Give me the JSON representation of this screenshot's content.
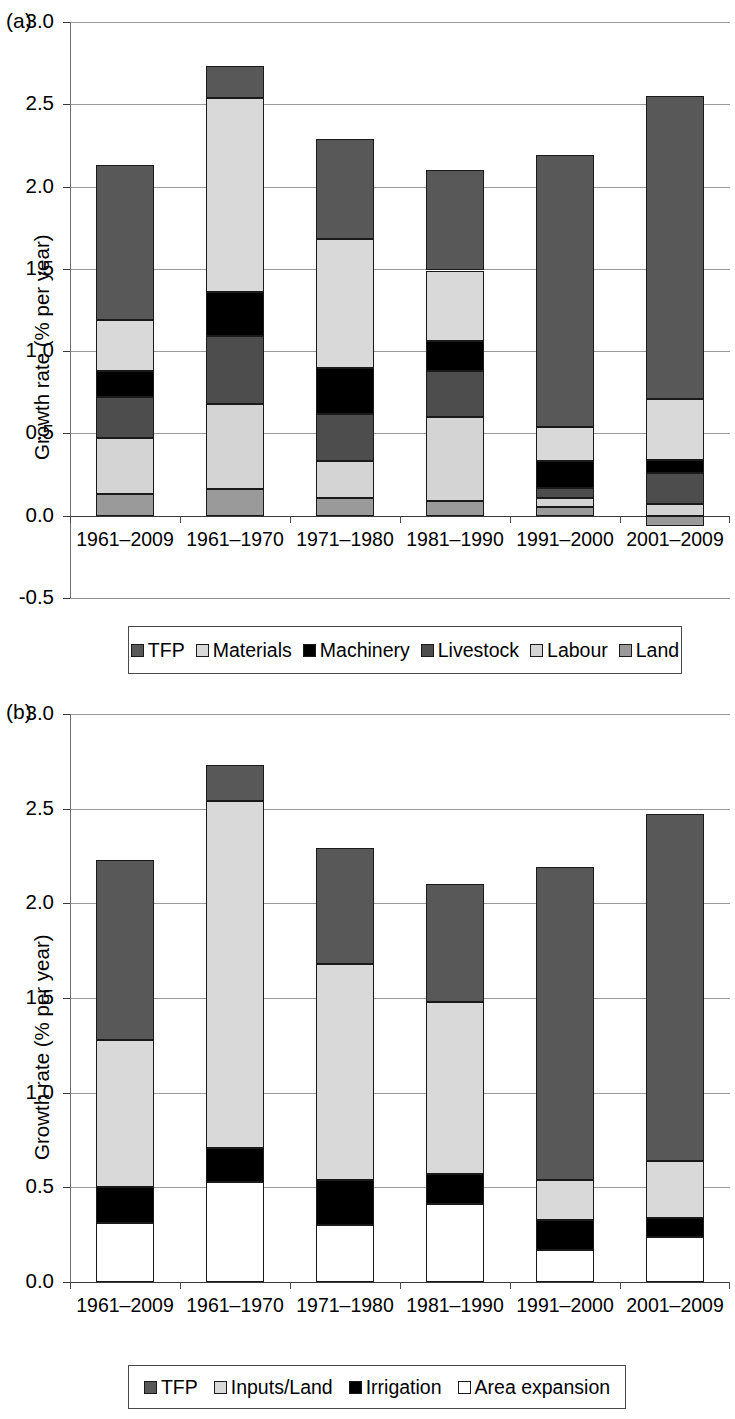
{
  "panels": [
    {
      "tag": "(a)",
      "ylabel": "Growth rate (% per year)",
      "xlabel": "",
      "legend": [
        {
          "label": "TFP",
          "color": "#585858"
        },
        {
          "label": "Materials",
          "color": "#d9d9d9"
        },
        {
          "label": "Machinery",
          "color": "#000000"
        },
        {
          "label": "Livestock",
          "color": "#4d4d4d"
        },
        {
          "label": "Labour",
          "color": "#d4d4d4"
        },
        {
          "label": "Land",
          "color": "#9a9a9a"
        }
      ]
    },
    {
      "tag": "(b)",
      "ylabel": "Growth rate (% per year)",
      "xlabel": "Year",
      "legend": [
        {
          "label": "TFP",
          "color": "#585858"
        },
        {
          "label": "Inputs/Land",
          "color": "#d9d9d9"
        },
        {
          "label": "Irrigation",
          "color": "#000000"
        },
        {
          "label": "Area expansion",
          "color": "#ffffff"
        }
      ]
    }
  ],
  "chart_data": [
    {
      "type": "bar",
      "stacked": true,
      "panel": "(a)",
      "title": "",
      "xlabel": "",
      "ylabel": "Growth rate (% per year)",
      "ylim": [
        -0.5,
        3.0
      ],
      "yticks": [
        "-0.5",
        "0.0",
        "0.5",
        "1.0",
        "1.5",
        "2.0",
        "2.5",
        "3.0"
      ],
      "ytick_values": [
        -0.5,
        0.0,
        0.5,
        1.0,
        1.5,
        2.0,
        2.5,
        3.0
      ],
      "grid": true,
      "legend_position": "bottom",
      "categories": [
        "1961–2009",
        "1961–1970",
        "1971–1980",
        "1981–1990",
        "1991–2000",
        "2001–2009"
      ],
      "series": [
        {
          "name": "Land",
          "color": "#9a9a9a",
          "values": [
            0.13,
            0.16,
            0.11,
            0.09,
            0.05,
            -0.06
          ]
        },
        {
          "name": "Labour",
          "color": "#d4d4d4",
          "values": [
            0.34,
            0.52,
            0.22,
            0.51,
            0.06,
            0.07
          ]
        },
        {
          "name": "Livestock",
          "color": "#4d4d4d",
          "values": [
            0.25,
            0.41,
            0.29,
            0.28,
            0.06,
            0.19
          ]
        },
        {
          "name": "Machinery",
          "color": "#000000",
          "values": [
            0.16,
            0.27,
            0.28,
            0.18,
            0.16,
            0.08
          ]
        },
        {
          "name": "Materials",
          "color": "#d9d9d9",
          "values": [
            0.31,
            1.18,
            0.78,
            0.43,
            0.21,
            0.37
          ]
        },
        {
          "name": "TFP",
          "color": "#585858",
          "values": [
            0.94,
            0.19,
            0.61,
            0.61,
            1.65,
            1.84
          ]
        }
      ],
      "totals": [
        2.13,
        2.73,
        2.29,
        2.1,
        2.19,
        2.55
      ]
    },
    {
      "type": "bar",
      "stacked": true,
      "panel": "(b)",
      "title": "",
      "xlabel": "Year",
      "ylabel": "Growth rate (% per year)",
      "ylim": [
        0.0,
        3.0
      ],
      "yticks": [
        "0.0",
        "0.5",
        "1.0",
        "1.5",
        "2.0",
        "2.5",
        "3.0"
      ],
      "ytick_values": [
        0.0,
        0.5,
        1.0,
        1.5,
        2.0,
        2.5,
        3.0
      ],
      "grid": true,
      "legend_position": "bottom",
      "categories": [
        "1961–2009",
        "1961–1970",
        "1971–1980",
        "1981–1990",
        "1991–2000",
        "2001–2009"
      ],
      "series": [
        {
          "name": "Area expansion",
          "color": "#ffffff",
          "values": [
            0.31,
            0.53,
            0.3,
            0.41,
            0.17,
            0.24
          ]
        },
        {
          "name": "Irrigation",
          "color": "#000000",
          "values": [
            0.19,
            0.18,
            0.24,
            0.16,
            0.16,
            0.1
          ]
        },
        {
          "name": "Inputs/Land",
          "color": "#d9d9d9",
          "values": [
            0.78,
            1.83,
            1.14,
            0.91,
            0.21,
            0.3
          ]
        },
        {
          "name": "TFP",
          "color": "#585858",
          "values": [
            0.95,
            0.19,
            0.61,
            0.62,
            1.65,
            1.83
          ]
        }
      ],
      "totals": [
        2.23,
        2.73,
        2.29,
        2.1,
        2.19,
        2.47
      ]
    }
  ]
}
